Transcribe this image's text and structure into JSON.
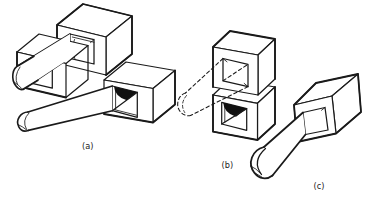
{
  "figures": [
    {
      "id": "a",
      "label": "(a)"
    },
    {
      "id": "b",
      "label": "(b)"
    },
    {
      "id": "c",
      "label": "(c)"
    }
  ],
  "colors": {
    "ink": "#1a1a1a",
    "dark_fill": "#111111",
    "background": "#ffffff"
  }
}
